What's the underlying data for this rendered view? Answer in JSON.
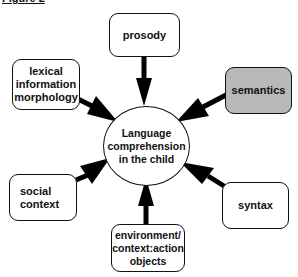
{
  "heading": "Figure 2",
  "diagram": {
    "center": {
      "label": "Language\ncomprehension\nin the child"
    },
    "nodes": [
      {
        "id": "prosody",
        "label": "prosody",
        "fill": "#ffffff"
      },
      {
        "id": "semantics",
        "label": "semantics",
        "fill": "#b8b8b8"
      },
      {
        "id": "lexical",
        "label": "lexical\ninformation\nmorphology",
        "fill": "#ffffff"
      },
      {
        "id": "social",
        "label": "social\ncontext",
        "fill": "#ffffff"
      },
      {
        "id": "syntax",
        "label": "syntax",
        "fill": "#ffffff"
      },
      {
        "id": "environment",
        "label": "environment/\ncontext:action\nobjects",
        "fill": "#ffffff"
      }
    ],
    "edges": [
      {
        "from": "prosody",
        "to": "center"
      },
      {
        "from": "semantics",
        "to": "center"
      },
      {
        "from": "lexical",
        "to": "center"
      },
      {
        "from": "social",
        "to": "center"
      },
      {
        "from": "syntax",
        "to": "center"
      },
      {
        "from": "environment",
        "to": "center"
      }
    ]
  }
}
